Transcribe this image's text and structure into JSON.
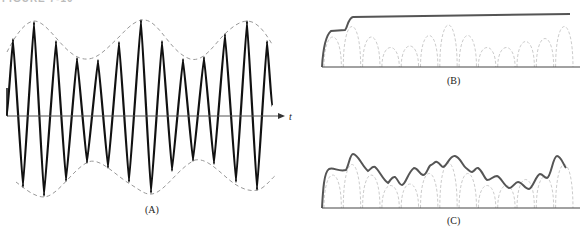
{
  "figure": {
    "title_clipped": "FIGURE 7-10",
    "colors": {
      "wave": "#111111",
      "envelope_dashed": "#999999",
      "detector_output": "#555555",
      "rectified_dashed": "#cccccc",
      "axis": "#333333"
    }
  },
  "panels": {
    "A": {
      "caption": "(A)",
      "axis_label": "t",
      "description": "AM modulated carrier with dashed envelope"
    },
    "B": {
      "caption": "(B)",
      "description": "Detector output with too-long time constant (peak hold)"
    },
    "C": {
      "caption": "(C)",
      "description": "Detector output following envelope with ripple"
    }
  },
  "chart_data": [
    {
      "type": "line",
      "title": "(A)",
      "xlabel": "t",
      "ylabel": "",
      "grid": false,
      "series": [
        {
          "name": "carrier peaks (x, y px)",
          "values": [
            [
              13,
              39
            ],
            [
              34,
              22
            ],
            [
              56,
              41
            ],
            [
              77,
              58
            ],
            [
              98,
              60
            ],
            [
              119,
              42
            ],
            [
              141,
              20
            ],
            [
              162,
              41
            ],
            [
              183,
              59
            ],
            [
              204,
              57
            ],
            [
              225,
              34
            ],
            [
              247,
              21
            ],
            [
              267,
              41
            ]
          ]
        },
        {
          "name": "carrier troughs (x, y px)",
          "values": [
            [
              23,
              187
            ],
            [
              44,
              196
            ],
            [
              66,
              181
            ],
            [
              87,
              163
            ],
            [
              108,
              168
            ],
            [
              129,
              182
            ],
            [
              151,
              193
            ],
            [
              172,
              171
            ],
            [
              193,
              161
            ],
            [
              214,
              164
            ],
            [
              236,
              182
            ],
            [
              257,
              190
            ]
          ]
        }
      ]
    },
    {
      "type": "line",
      "title": "(B)",
      "series": [
        {
          "name": "detector output",
          "values": [
            [
              322,
              67
            ],
            [
              330,
              31
            ],
            [
              345,
              30
            ],
            [
              352,
              17
            ],
            [
              570,
              14
            ]
          ]
        }
      ]
    },
    {
      "type": "line",
      "title": "(C)",
      "series": [
        {
          "name": "detector output",
          "values": [
            [
              322,
              208
            ],
            [
              328,
              169
            ],
            [
              346,
              171
            ],
            [
              352,
              154
            ],
            [
              368,
              172
            ],
            [
              374,
              167
            ],
            [
              387,
              183
            ],
            [
              393,
              177
            ],
            [
              400,
              185
            ],
            [
              414,
              168
            ],
            [
              422,
              175
            ],
            [
              436,
              162
            ],
            [
              442,
              167
            ],
            [
              454,
              156
            ],
            [
              470,
              172
            ],
            [
              477,
              168
            ],
            [
              486,
              180
            ],
            [
              496,
              176
            ],
            [
              508,
              188
            ],
            [
              517,
              182
            ],
            [
              528,
              189
            ],
            [
              539,
              174
            ],
            [
              546,
              178
            ],
            [
              556,
              156
            ],
            [
              565,
              168
            ]
          ]
        }
      ]
    }
  ]
}
